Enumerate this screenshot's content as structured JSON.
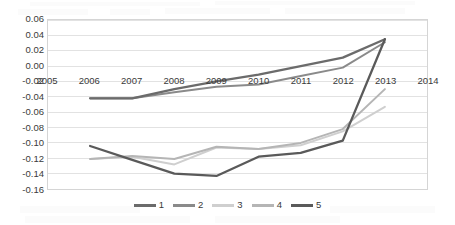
{
  "chart_data": {
    "type": "line",
    "title": "",
    "subtitle": "",
    "xlabel": "",
    "ylabel": "",
    "xlim": [
      2005,
      2014
    ],
    "ylim": [
      -0.16,
      0.06
    ],
    "ytick_step": 0.02,
    "grid": true,
    "grid_axis": "y",
    "legend_position": "bottom",
    "x": [
      2006,
      2007,
      2008,
      2009,
      2010,
      2011,
      2012,
      2013
    ],
    "xtick_labels": [
      "2005",
      "2006",
      "2007",
      "2008",
      "2009",
      "2010",
      "2011",
      "2012",
      "2013",
      "2014"
    ],
    "ytick_labels": [
      "0.06",
      "0.04",
      "0.02",
      "0.00",
      "-0.02",
      "-0.04",
      "-0.06",
      "-0.08",
      "-0.10",
      "-0.12",
      "-0.14",
      "-0.16"
    ],
    "ytick_values": [
      0.06,
      0.04,
      0.02,
      0.0,
      -0.02,
      -0.04,
      -0.06,
      -0.08,
      -0.1,
      -0.12,
      -0.14,
      -0.16
    ],
    "series": [
      {
        "name": "1",
        "color": "#6b6b6b",
        "values": [
          -0.042,
          -0.042,
          -0.03,
          -0.02,
          -0.011,
          0.0,
          0.011,
          0.035
        ]
      },
      {
        "name": "2",
        "color": "#8a8a8a",
        "values": [
          -0.042,
          -0.042,
          -0.034,
          -0.027,
          -0.024,
          -0.013,
          -0.002,
          0.031
        ]
      },
      {
        "name": "3",
        "color": "#cfcfcf",
        "values": [
          -0.121,
          -0.118,
          -0.128,
          -0.106,
          -0.108,
          -0.103,
          -0.085,
          -0.053
        ]
      },
      {
        "name": "4",
        "color": "#b5b5b5",
        "values": [
          -0.121,
          -0.117,
          -0.121,
          -0.105,
          -0.108,
          -0.1,
          -0.082,
          -0.03
        ]
      },
      {
        "name": "5",
        "color": "#5a5a5a",
        "values": [
          -0.104,
          -0.122,
          -0.14,
          -0.143,
          -0.118,
          -0.113,
          -0.097,
          0.035
        ]
      }
    ]
  },
  "legend": {
    "items": [
      {
        "label": "1"
      },
      {
        "label": "2"
      },
      {
        "label": "3"
      },
      {
        "label": "4"
      },
      {
        "label": "5"
      }
    ]
  }
}
